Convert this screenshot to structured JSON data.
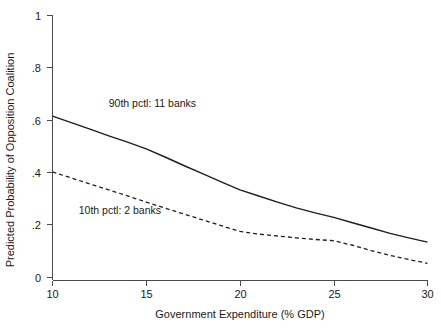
{
  "chart_data": {
    "type": "line",
    "title": "",
    "xlabel": "Government Expenditure (% GDP)",
    "ylabel": "Predicted Probability of Opposition Coalition",
    "xlim": [
      10,
      30
    ],
    "ylim": [
      0,
      1
    ],
    "grid": false,
    "legend_position": "inline-annotation",
    "xticks": [
      10,
      15,
      20,
      25,
      30
    ],
    "xtick_labels": [
      "10",
      "15",
      "20",
      "25",
      "30"
    ],
    "yticks": [
      0,
      0.2,
      0.4,
      0.6,
      0.8,
      1
    ],
    "ytick_labels": [
      "0",
      ".2",
      ".4",
      ".6",
      ".8",
      "1"
    ],
    "x": [
      10,
      11,
      12,
      13,
      14,
      15,
      16,
      17,
      18,
      19,
      20,
      21,
      22,
      23,
      24,
      25,
      26,
      27,
      28,
      29,
      30
    ],
    "series": [
      {
        "name": "90th pctl: 11 banks",
        "style": "solid",
        "color": "#1f1f1f",
        "values": [
          0.62,
          0.596,
          0.571,
          0.546,
          0.522,
          0.497,
          0.466,
          0.434,
          0.403,
          0.372,
          0.342,
          0.319,
          0.296,
          0.274,
          0.255,
          0.238,
          0.218,
          0.198,
          0.178,
          0.161,
          0.145
        ]
      },
      {
        "name": "10th pctl: 2 banks",
        "style": "dashed",
        "color": "#1f1f1f",
        "values": [
          0.41,
          0.387,
          0.364,
          0.342,
          0.319,
          0.296,
          0.273,
          0.251,
          0.229,
          0.207,
          0.185,
          0.175,
          0.168,
          0.161,
          0.155,
          0.15,
          0.133,
          0.113,
          0.095,
          0.079,
          0.065
        ]
      }
    ],
    "annotations": [
      {
        "text": "90th pctl: 11 banks",
        "x": 13.0,
        "y": 0.655
      },
      {
        "text": "10th pctl: 2 banks",
        "x": 11.4,
        "y": 0.25
      }
    ]
  }
}
